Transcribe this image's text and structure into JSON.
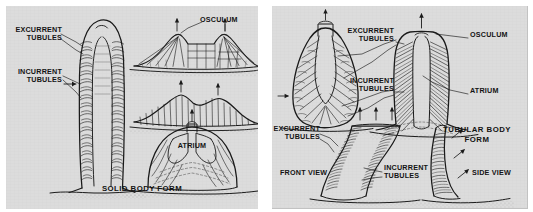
{
  "figure": {
    "background_color": "#ffffff",
    "panel_color": "#dcdcdc",
    "ink_color": "#1a1a1a"
  },
  "panels": [
    {
      "id": "solid-body-form",
      "caption": "SOLID BODY FORM",
      "labels": [
        {
          "id": "excurrent-tubules",
          "text": "EXCURRENT\nTUBULES"
        },
        {
          "id": "incurrent-tubules",
          "text": "INCURRENT\nTUBULES"
        },
        {
          "id": "osculum",
          "text": "OSCULUM"
        },
        {
          "id": "atrium",
          "text": "ATRIUM"
        }
      ],
      "specimens": [
        {
          "id": "finger-sponge",
          "shape": "tall-finger",
          "view": "longitudinal-section"
        },
        {
          "id": "encrusting-sponge-upper",
          "shape": "low-mound",
          "view": "section"
        },
        {
          "id": "encrusting-sponge-middle",
          "shape": "low-mound",
          "view": "section"
        },
        {
          "id": "dome-sponge",
          "shape": "dome",
          "view": "section"
        }
      ]
    },
    {
      "id": "tubular-body-form",
      "caption": "TUBULAR BODY\nFORM",
      "labels": [
        {
          "id": "excurrent-tubules-upper",
          "text": "EXCURRENT\nTUBULES"
        },
        {
          "id": "incurrent-tubules-upper",
          "text": "INCURRENT\nTUBULES"
        },
        {
          "id": "osculum",
          "text": "OSCULUM"
        },
        {
          "id": "atrium",
          "text": "ATRIUM"
        },
        {
          "id": "excurrent-tubules-lower",
          "text": "EXCURRENT\nTUBULES"
        },
        {
          "id": "incurrent-tubules-lower",
          "text": "INCURRENT\nTUBULES"
        },
        {
          "id": "front-view",
          "text": "FRONT VIEW"
        },
        {
          "id": "side-view",
          "text": "SIDE VIEW"
        }
      ],
      "specimens": [
        {
          "id": "ovoid-sponge",
          "shape": "ovoid",
          "view": "longitudinal-section"
        },
        {
          "id": "tube-sponge",
          "shape": "tube",
          "view": "longitudinal-section"
        },
        {
          "id": "vase-sponge-front",
          "shape": "vase",
          "view": "front"
        },
        {
          "id": "vase-sponge-side",
          "shape": "blade",
          "view": "side"
        }
      ]
    }
  ]
}
